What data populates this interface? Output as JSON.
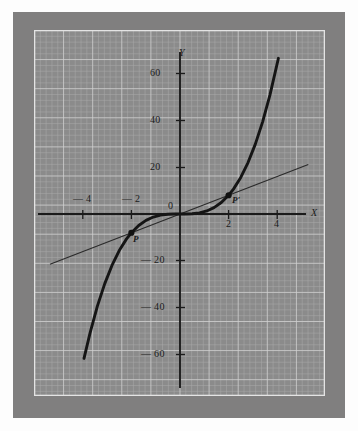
{
  "figure": {
    "kind": "graph-paper-plot",
    "background_color": "#807f7f",
    "paper_color": "#8b8b8b",
    "grid_minor_color": "#a5a5a5",
    "grid_major_color": "#cfcfcf",
    "ink_color": "#1b1b1b"
  },
  "chart_data": {
    "type": "line",
    "title": "",
    "xlabel": "X",
    "ylabel": "Y",
    "xlim": [
      -5.6,
      5.6
    ],
    "ylim": [
      -78,
      78
    ],
    "grid": true,
    "legend": "none",
    "xticks": [
      -4,
      -2,
      2,
      4
    ],
    "xticklabels": [
      "— 4",
      "— 2",
      "2",
      "4"
    ],
    "yticks": [
      60,
      40,
      20,
      -20,
      -40,
      -60
    ],
    "yticklabels": [
      "60",
      "40",
      "20",
      "— 20",
      "— 40",
      "— 60"
    ],
    "origin_label": "0",
    "series": [
      {
        "name": "cubic-curve",
        "expression": "y = x^3",
        "style": "solid-thick",
        "x": [
          -3.95,
          -3.7,
          -3.4,
          -3.1,
          -2.8,
          -2.5,
          -2.2,
          -2.0,
          -1.7,
          -1.4,
          -1.1,
          -0.8,
          -0.5,
          -0.2,
          0,
          0.2,
          0.5,
          0.8,
          1.1,
          1.4,
          1.7,
          2.0,
          2.2,
          2.5,
          2.8,
          3.1,
          3.4,
          3.7,
          4.05
        ],
        "y": [
          -61.6,
          -50.7,
          -39.3,
          -29.8,
          -21.95,
          -15.6,
          -10.6,
          -8.0,
          -4.9,
          -2.7,
          -1.3,
          -0.5,
          -0.125,
          -0.008,
          0,
          0.008,
          0.125,
          0.5,
          1.3,
          2.7,
          4.9,
          8.0,
          10.6,
          15.6,
          21.95,
          29.8,
          39.3,
          50.7,
          66.4
        ]
      },
      {
        "name": "secant-line",
        "expression": "y = 4x",
        "style": "solid-thin",
        "x": [
          -5.35,
          5.28
        ],
        "y": [
          -21.4,
          21.1
        ]
      }
    ],
    "annotations": [
      {
        "name": "point-P",
        "label": "P",
        "x": -2,
        "y": -8,
        "marker": "dot"
      },
      {
        "name": "point-P-prime",
        "label": "P′",
        "x": 2,
        "y": 8,
        "marker": "dot"
      }
    ]
  },
  "labels": {
    "y_axis": "Y",
    "x_axis": "X",
    "origin": "0",
    "y_60": "60",
    "y_40": "40",
    "y_20": "20",
    "y_m20": "— 20",
    "y_m40": "— 40",
    "y_m60": "— 60",
    "x_m4": "— 4",
    "x_m2": "— 2",
    "x_2": "2",
    "x_4": "4",
    "p": "P",
    "p_prime": "P′"
  }
}
